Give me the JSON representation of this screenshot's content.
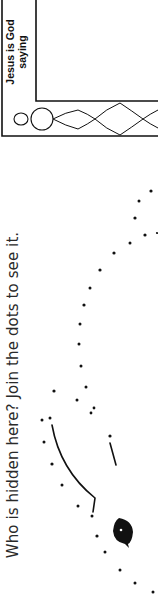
{
  "worksheet": {
    "instruction": "Who is hidden here? Join the dots to see it.",
    "frame": {
      "caption_line1": "Jesus is God",
      "caption_line2": "saying"
    }
  },
  "colors": {
    "ink": "#111111",
    "paper": "#ffffff",
    "text": "#2a2a2a"
  },
  "dots": [
    [
      151,
      191
    ],
    [
      139,
      201
    ],
    [
      135,
      218
    ],
    [
      145,
      235
    ],
    [
      157,
      233
    ],
    [
      130,
      243
    ],
    [
      114,
      253
    ],
    [
      100,
      270
    ],
    [
      90,
      288
    ],
    [
      84,
      305
    ],
    [
      80,
      324
    ],
    [
      79,
      344
    ],
    [
      81,
      366
    ],
    [
      86,
      387
    ],
    [
      77,
      400
    ],
    [
      94,
      408
    ],
    [
      91,
      413
    ],
    [
      54,
      391
    ],
    [
      50,
      418
    ],
    [
      42,
      420
    ],
    [
      44,
      442
    ],
    [
      52,
      464
    ],
    [
      62,
      485
    ],
    [
      78,
      506
    ],
    [
      92,
      516
    ],
    [
      97,
      536
    ],
    [
      105,
      552
    ],
    [
      120,
      570
    ],
    [
      135,
      583
    ],
    [
      153,
      592
    ],
    [
      110,
      436
    ]
  ]
}
